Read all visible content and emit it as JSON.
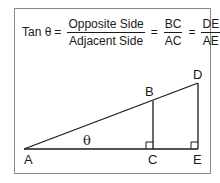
{
  "formula": {
    "lhs": "Tan θ",
    "eq": "=",
    "fractions": [
      {
        "numerator": "Opposite Side",
        "denominator": "Adjacent Side"
      },
      {
        "numerator": "BC",
        "denominator": "AC"
      },
      {
        "numerator": "DE",
        "denominator": "AE"
      }
    ]
  },
  "diagram": {
    "points": {
      "A": {
        "label": "A",
        "x": 24,
        "y": 149
      },
      "B": {
        "label": "B",
        "x": 153,
        "y": 101
      },
      "C": {
        "label": "C",
        "x": 153,
        "y": 149
      },
      "D": {
        "label": "D",
        "x": 198,
        "y": 83
      },
      "E": {
        "label": "E",
        "x": 198,
        "y": 149
      }
    },
    "angle_label": "θ",
    "right_angles": [
      "C",
      "E"
    ],
    "line_color": "#1a1a1a",
    "frame_color": "#8a8a8a"
  }
}
